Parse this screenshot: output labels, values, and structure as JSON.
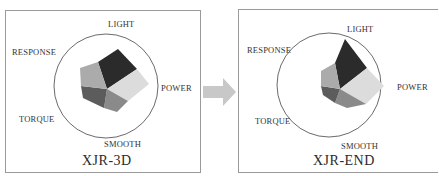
{
  "diagram": {
    "type": "radar-polygon-comparison",
    "axes": [
      "LIGHT",
      "POWER",
      "SMOOTH",
      "TORQUE",
      "RESPONSE"
    ],
    "arrow_color": "#c8c8c8",
    "segment_colors": {
      "LIGHT": "#2b2b2b",
      "POWER": "#dcdcdc",
      "SMOOTH": "#8a8a8a",
      "TORQUE": "#5c5c5c",
      "RESPONSE": "#ababab"
    }
  },
  "panels": [
    {
      "model": "XJR-3D",
      "labels": {
        "light": "LIGHT",
        "power": "POWER",
        "smooth": "SMOOTH",
        "torque": "TORQUE",
        "response": "RESPONSE"
      }
    },
    {
      "model": "XJR-END",
      "labels": {
        "light": "LIGHT",
        "power": "POWER",
        "smooth": "SMOOTH",
        "torque": "TORQUE",
        "response": "RESPONSE"
      }
    }
  ]
}
